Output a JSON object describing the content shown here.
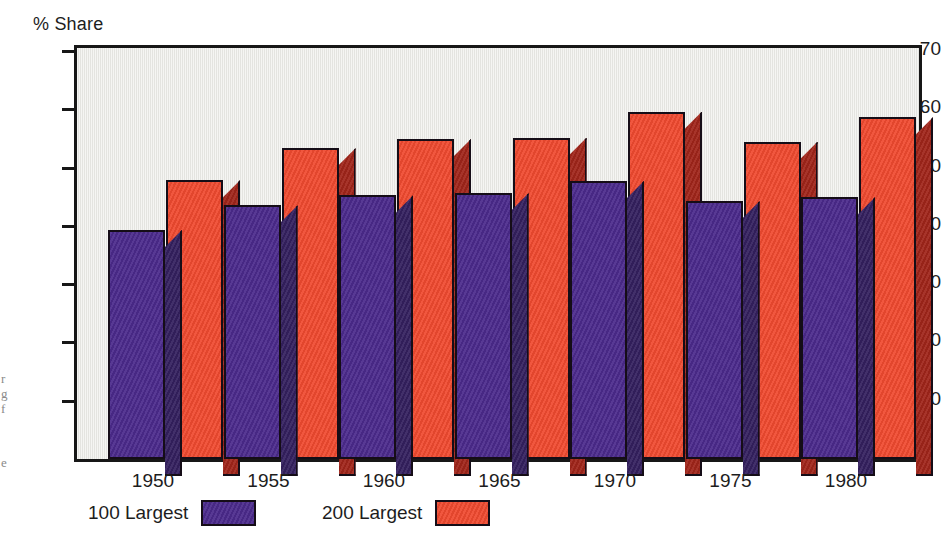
{
  "chart_data": {
    "type": "bar",
    "title": "",
    "subtitle": "",
    "ylabel": "% Share",
    "xlabel": "",
    "categories": [
      "1950",
      "1955",
      "1960",
      "1965",
      "1970",
      "1975",
      "1980"
    ],
    "series": [
      {
        "name": "100 Largest",
        "color": "#4B2A8C",
        "side_color": "#34205F",
        "values": [
          39.3,
          43.5,
          45.2,
          45.6,
          47.7,
          44.2,
          44.9
        ]
      },
      {
        "name": "200 Largest",
        "color": "#F04A30",
        "side_color": "#A0251A",
        "values": [
          47.8,
          53.3,
          54.9,
          55.1,
          59.6,
          54.4,
          58.6
        ]
      }
    ],
    "ylim": [
      0,
      75
    ],
    "yticks": [
      10,
      20,
      30,
      40,
      50,
      60,
      70
    ],
    "ytick_labels": [
      "10",
      "20",
      "30",
      "40",
      "50",
      "60",
      "70"
    ],
    "grid": false,
    "legend_position": "bottom-left",
    "style": "3d-bars",
    "plot_background": "#E9E9E5",
    "frame_color": "#171717"
  },
  "axis": {
    "y_title": "% Share"
  },
  "legend": {
    "items": [
      {
        "label": "100 Largest",
        "color": "#4B2A8C"
      },
      {
        "label": "200 Largest",
        "color": "#F04A30"
      }
    ]
  },
  "page_bleed": {
    "line1": "r",
    "line2": "g",
    "line3": "f",
    "line4": "e"
  }
}
